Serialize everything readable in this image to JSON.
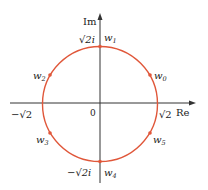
{
  "diagram": {
    "colors": {
      "circle": "#e0573a",
      "axis": "#333333",
      "text": "#222222"
    },
    "axes": {
      "real_label": "Re",
      "imag_label": "Im",
      "origin_label": "0",
      "ticks": {
        "pos_real": "√2",
        "neg_real": "−√2",
        "pos_imag": "√2i",
        "neg_imag": "−√2i"
      }
    },
    "points": [
      {
        "name": "w0",
        "base": "w",
        "sub": "0",
        "angle_deg": 30
      },
      {
        "name": "w1",
        "base": "w",
        "sub": "1",
        "angle_deg": 90
      },
      {
        "name": "w2",
        "base": "w",
        "sub": "2",
        "angle_deg": 150
      },
      {
        "name": "w3",
        "base": "w",
        "sub": "3",
        "angle_deg": 210
      },
      {
        "name": "w4",
        "base": "w",
        "sub": "4",
        "angle_deg": 270
      },
      {
        "name": "w5",
        "base": "w",
        "sub": "5",
        "angle_deg": 330
      }
    ]
  }
}
